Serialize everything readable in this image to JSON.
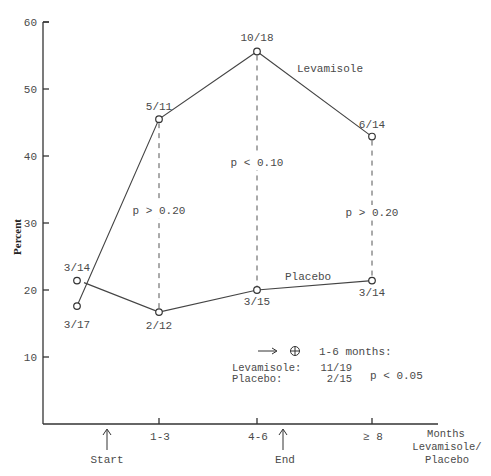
{
  "chart_data": {
    "type": "line",
    "title": "",
    "xlabel": "Months Levamisole/ Placebo",
    "xlabel_lines": [
      "Months",
      "Levamisole/",
      "Placebo"
    ],
    "ylabel": "Percent",
    "ylim": [
      0,
      60
    ],
    "yticks": [
      10,
      20,
      30,
      40,
      50,
      60
    ],
    "ytick_labels": [
      "10",
      "20",
      "30",
      "40",
      "50",
      "60"
    ],
    "categories": [
      "Start",
      "1-3",
      "4-6",
      "≥ 8"
    ],
    "xtick_labels": [
      "1-3",
      "4-6",
      "≥ 8"
    ],
    "series": [
      {
        "name": "Levamisole",
        "values": [
          17.6,
          45.5,
          55.6,
          42.9
        ],
        "labels": [
          "3/17",
          "5/11",
          "10/18",
          "6/14"
        ]
      },
      {
        "name": "Placebo",
        "values": [
          21.4,
          16.7,
          20.0,
          21.4
        ],
        "labels": [
          "3/14",
          "2/12",
          "3/15",
          "3/14"
        ]
      }
    ],
    "comparisons": [
      {
        "category": "1-3",
        "text": "p > 0.20"
      },
      {
        "category": "4-6",
        "text": "p < 0.10"
      },
      {
        "category": "≥ 8",
        "text": "p > 0.20"
      }
    ],
    "markers": [
      {
        "label": "Start"
      },
      {
        "label": "End"
      }
    ],
    "summary": {
      "arrow_text": "→ ⊕",
      "heading": "1-6 months:",
      "rows": [
        {
          "group": "Levamisole:",
          "value": "11/19"
        },
        {
          "group": "Placebo:",
          "value": "2/15"
        }
      ],
      "p_value": "p < 0.05"
    },
    "grid": false,
    "legend": "inline-labels"
  }
}
